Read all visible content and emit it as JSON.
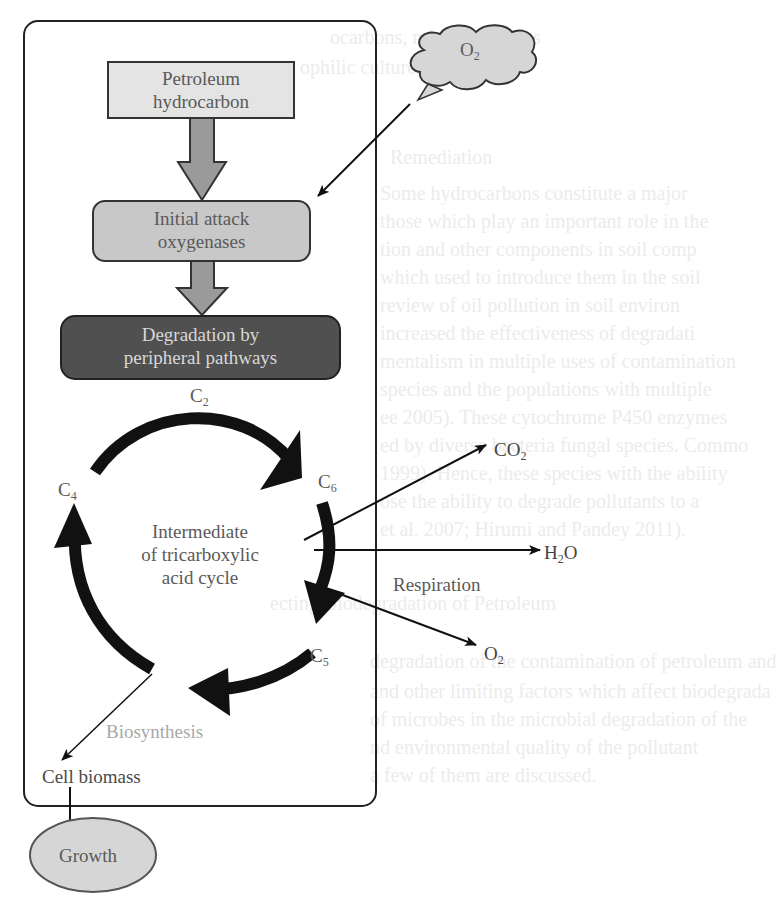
{
  "diagram": {
    "nodes": {
      "petroleum": {
        "line1": "Petroleum",
        "line2": "hydrocarbon"
      },
      "initial_attack": {
        "line1": "Initial attack",
        "line2": "oxygenases"
      },
      "degradation": {
        "line1": "Degradation by",
        "line2": "peripheral pathways"
      },
      "tca": {
        "line1": "Intermediate",
        "line2": "of tricarboxylic",
        "line3": "acid cycle"
      },
      "cell_biomass": "Cell biomass",
      "growth": "Growth",
      "oxygen_cloud": {
        "base": "O",
        "sub": "2"
      }
    },
    "cycle_labels": {
      "c2": {
        "base": "C",
        "sub": "2"
      },
      "c6": {
        "base": "C",
        "sub": "6"
      },
      "c5": {
        "base": "C",
        "sub": "5"
      },
      "c4": {
        "base": "C",
        "sub": "4"
      }
    },
    "outputs": {
      "co2": {
        "base": "CO",
        "sub": "2"
      },
      "h2o": {
        "pre": "H",
        "sub": "2",
        "post": "O"
      },
      "o2": {
        "base": "O",
        "sub": "2"
      }
    },
    "edge_labels": {
      "respiration": "Respiration",
      "biosynthesis": "Biosynthesis"
    },
    "colors": {
      "light_box": "#e4e4e4",
      "mid_box": "#c8c8c8",
      "dark_box": "#505050",
      "arrow_fill": "#9a9a9a",
      "cycle": "#111111"
    }
  },
  "bleed_through": [
    "ocarbons, microorganisms",
    "ophilic cultures",
    "Remediation",
    "Some hydrocarbons constitute a major",
    "those which play an important role in the",
    "tion and other components in soil comp",
    "which used to introduce them in the soil",
    "review of oil pollution in soil environ",
    "increased the effectiveness of degradati",
    "mentalism in multiple uses of contamination",
    "species and the populations with multiple",
    "ee 2005). These cytochrome P450 enzymes",
    "ed by diverse bacteria fungal species. Commo",
    "1999). Hence, these species with the ability",
    "ose the ability to degrade pollutants to a",
    "et al. 2007; Hirumi and Pandey 2011).",
    "ecting Biodegradation of Petroleum",
    "degradation of the contamination of petroleum and",
    "and other limiting factors which affect biodegrada",
    "of microbes in the microbial degradation of the",
    "nd environmental quality of the pollutant",
    "a few of them are discussed."
  ]
}
